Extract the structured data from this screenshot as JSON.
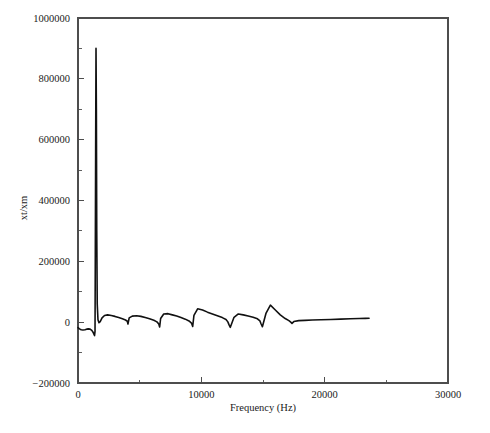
{
  "chart_data": {
    "type": "line",
    "title": "",
    "xlabel": "Frequency (Hz)",
    "ylabel": "xt/xm",
    "xlim": [
      0,
      30000
    ],
    "ylim": [
      -200000,
      1000000
    ],
    "grid": false,
    "legend": null,
    "xticks": [
      0,
      10000,
      20000,
      30000
    ],
    "xticklabels": [
      "0",
      "10000",
      "20000",
      "30000"
    ],
    "xminorticks": [
      5000,
      15000,
      25000
    ],
    "yticks": [
      -200000,
      0,
      200000,
      400000,
      600000,
      800000,
      1000000
    ],
    "yticklabels": [
      "−200000",
      "0",
      "200000",
      "400000",
      "600000",
      "800000",
      "1000000"
    ],
    "yminorticks": [
      -100000,
      100000,
      300000,
      500000,
      700000,
      900000
    ],
    "line_color": "#111111",
    "series": [
      {
        "name": "xt/xm",
        "x": [
          0,
          120,
          260,
          400,
          560,
          700,
          840,
          980,
          1120,
          1220,
          1300,
          1340,
          1380,
          1400,
          1430,
          1460,
          1490,
          1520,
          1560,
          1620,
          1700,
          1800,
          1950,
          2150,
          2400,
          2700,
          3000,
          3300,
          3600,
          3850,
          4000,
          4050,
          4150,
          4400,
          4750,
          5100,
          5450,
          5800,
          6150,
          6400,
          6550,
          6620,
          6700,
          6950,
          7300,
          7650,
          8000,
          8350,
          8700,
          9000,
          9200,
          9300,
          9400,
          9700,
          10100,
          10500,
          10900,
          11300,
          11700,
          12000,
          12150,
          12250,
          12350,
          12650,
          13000,
          13400,
          13800,
          14200,
          14550,
          14750,
          14850,
          14950,
          15250,
          15600,
          16000,
          16400,
          16800,
          17100,
          17250,
          17350,
          17500,
          17900,
          18400,
          19000,
          19700,
          20500,
          21300,
          22100,
          22800,
          23300,
          23600
        ],
        "y": [
          -18000,
          -22000,
          -25000,
          -26000,
          -25000,
          -23000,
          -22000,
          -23000,
          -27000,
          -33000,
          -40000,
          -44000,
          -30000,
          180000,
          560000,
          900000,
          700000,
          300000,
          60000,
          8000,
          -2000,
          2000,
          14000,
          22000,
          24000,
          22000,
          19000,
          15000,
          11000,
          7000,
          3000,
          -6000,
          14000,
          20000,
          21000,
          19000,
          15000,
          11000,
          6000,
          1000,
          -6000,
          -16000,
          12000,
          27000,
          28000,
          24000,
          20000,
          15000,
          10000,
          4000,
          -3000,
          -14000,
          22000,
          44000,
          40000,
          33000,
          27000,
          21000,
          15000,
          9000,
          1000,
          -9000,
          -17000,
          16000,
          27000,
          24000,
          20000,
          16000,
          11000,
          4000,
          -6000,
          -15000,
          30000,
          56000,
          40000,
          24000,
          12000,
          5000,
          0,
          -4000,
          2000,
          5000,
          6000,
          7000,
          8000,
          9000,
          10000,
          11000,
          12000,
          12500,
          13000
        ]
      }
    ],
    "annotations": []
  },
  "axes": {
    "xlabel": "Frequency (Hz)",
    "ylabel": "xt/xm"
  }
}
